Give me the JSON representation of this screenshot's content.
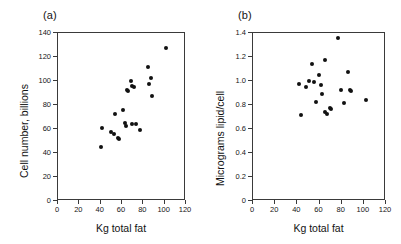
{
  "figure": {
    "background": "#ffffff",
    "marker_color": "#111111",
    "axis_color": "#3a3a3a"
  },
  "panels": [
    {
      "key": "a",
      "label": "(a)"
    },
    {
      "key": "b",
      "label": "(b)"
    }
  ],
  "chart_data": [
    {
      "type": "scatter",
      "panel": "(a)",
      "title": "",
      "xlabel": "Kg total fat",
      "ylabel": "Cell number, billions",
      "xlim": [
        0,
        120
      ],
      "ylim": [
        0,
        140
      ],
      "xticks": [
        0,
        20,
        40,
        60,
        80,
        100,
        120
      ],
      "yticks": [
        0,
        20,
        40,
        60,
        80,
        100,
        120,
        140
      ],
      "xticklabels": [
        "0",
        "20",
        "40",
        "60",
        "80",
        "100",
        "120"
      ],
      "yticklabels": [
        "0",
        "20",
        "40",
        "60",
        "80",
        "100",
        "120",
        "140"
      ],
      "grid": false,
      "legend": false,
      "marker": "filled-circle",
      "points": [
        {
          "x": 41,
          "y": 44
        },
        {
          "x": 42,
          "y": 60
        },
        {
          "x": 51,
          "y": 57
        },
        {
          "x": 53,
          "y": 55
        },
        {
          "x": 54,
          "y": 72
        },
        {
          "x": 57,
          "y": 52
        },
        {
          "x": 58,
          "y": 51
        },
        {
          "x": 62,
          "y": 75
        },
        {
          "x": 64,
          "y": 64
        },
        {
          "x": 65,
          "y": 62
        },
        {
          "x": 66,
          "y": 92
        },
        {
          "x": 67,
          "y": 91
        },
        {
          "x": 69,
          "y": 99
        },
        {
          "x": 70,
          "y": 63
        },
        {
          "x": 70,
          "y": 95
        },
        {
          "x": 72,
          "y": 94
        },
        {
          "x": 74,
          "y": 63
        },
        {
          "x": 78,
          "y": 58
        },
        {
          "x": 85,
          "y": 111
        },
        {
          "x": 86,
          "y": 97
        },
        {
          "x": 88,
          "y": 102
        },
        {
          "x": 89,
          "y": 87
        },
        {
          "x": 102,
          "y": 127
        }
      ]
    },
    {
      "type": "scatter",
      "panel": "(b)",
      "title": "",
      "xlabel": "Kg total fat",
      "ylabel": "Micrograms lipid/cell",
      "xlim": [
        0,
        120
      ],
      "ylim": [
        0,
        1.4
      ],
      "xticks": [
        0,
        20,
        40,
        60,
        80,
        100,
        120
      ],
      "yticks": [
        0,
        0.2,
        0.4,
        0.6,
        0.8,
        1.0,
        1.2,
        1.4
      ],
      "xticklabels": [
        "0",
        "20",
        "40",
        "60",
        "80",
        "100",
        "120"
      ],
      "yticklabels": [
        "0",
        "0.2",
        "0.4",
        "0.6",
        "0.8",
        "1.0",
        "1.2",
        "1.4"
      ],
      "grid": false,
      "legend": false,
      "marker": "filled-circle",
      "points": [
        {
          "x": 42,
          "y": 0.97
        },
        {
          "x": 44,
          "y": 0.71
        },
        {
          "x": 49,
          "y": 0.94
        },
        {
          "x": 51,
          "y": 0.99
        },
        {
          "x": 54,
          "y": 1.13
        },
        {
          "x": 56,
          "y": 0.98
        },
        {
          "x": 58,
          "y": 0.82
        },
        {
          "x": 60,
          "y": 1.04
        },
        {
          "x": 62,
          "y": 0.96
        },
        {
          "x": 63,
          "y": 0.88
        },
        {
          "x": 66,
          "y": 1.17
        },
        {
          "x": 66,
          "y": 0.73
        },
        {
          "x": 68,
          "y": 0.72
        },
        {
          "x": 70,
          "y": 0.77
        },
        {
          "x": 71,
          "y": 0.76
        },
        {
          "x": 78,
          "y": 1.35
        },
        {
          "x": 80,
          "y": 0.92
        },
        {
          "x": 83,
          "y": 0.81
        },
        {
          "x": 87,
          "y": 1.07
        },
        {
          "x": 88,
          "y": 0.92
        },
        {
          "x": 89,
          "y": 0.91
        },
        {
          "x": 103,
          "y": 0.83
        }
      ]
    }
  ]
}
